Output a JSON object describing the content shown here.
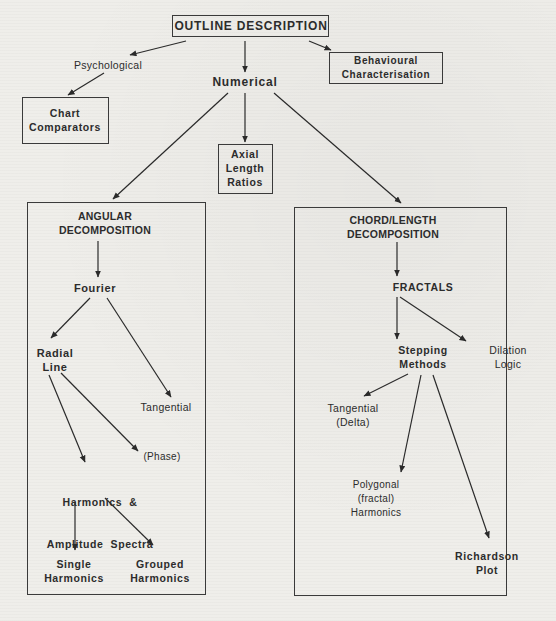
{
  "diagram": {
    "root": {
      "label": "OUTLINE DESCRIPTION"
    },
    "branches": {
      "psychological": {
        "label": "Psychological"
      },
      "numerical": {
        "label": "Numerical"
      },
      "behavioural": {
        "lines": [
          "Behavioural",
          "Characterisation"
        ]
      },
      "chart_comparators": {
        "lines": [
          "Chart",
          "Comparators"
        ]
      },
      "axial": {
        "lines": [
          "Axial",
          "Length",
          "Ratios"
        ]
      }
    },
    "angular_panel": {
      "title_lines": [
        "ANGULAR",
        "DECOMPOSITION"
      ],
      "fourier": "Fourier",
      "radial_line": [
        "Radial",
        "Line"
      ],
      "tangential": "Tangential",
      "phase": "(Phase)",
      "harmonics_amplitude": [
        "Harmonics  &",
        "Amplitude  Spectra"
      ],
      "single_harmonics": [
        "Single",
        "Harmonics"
      ],
      "grouped_harmonics": [
        "Grouped",
        "Harmonics"
      ]
    },
    "chord_panel": {
      "title_lines": [
        "CHORD/LENGTH",
        "DECOMPOSITION"
      ],
      "fractals": "FRACTALS",
      "stepping_methods": [
        "Stepping",
        "Methods"
      ],
      "dilation_logic": [
        "Dilation",
        "Logic"
      ],
      "tangential_delta": [
        "Tangential",
        "(Delta)"
      ],
      "polygonal": [
        "Polygonal",
        "(fractal)",
        "Harmonics"
      ],
      "richardson_plot": [
        "Richardson",
        "Plot"
      ]
    },
    "colors": {
      "ink": "#2c2c2c",
      "paper": "#efeeea"
    }
  }
}
